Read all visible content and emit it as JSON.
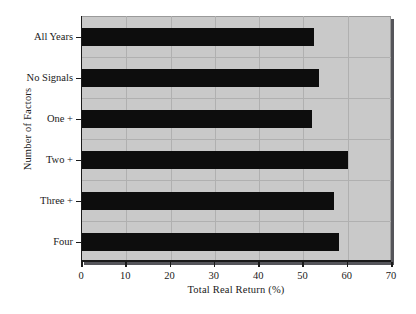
{
  "chart_data": {
    "type": "bar",
    "orientation": "horizontal",
    "title": "",
    "xlabel": "Total Real Return (%)",
    "ylabel": "Number of Factors",
    "categories": [
      "All Years",
      "No Signals",
      "One +",
      "Two +",
      "Three +",
      "Four"
    ],
    "values": [
      52.4,
      53.5,
      51.9,
      60.0,
      56.9,
      58.0
    ],
    "xlim": [
      0,
      70
    ],
    "xticks": [
      0,
      10,
      20,
      30,
      40,
      50,
      60,
      70
    ],
    "xtick_labels": [
      "0",
      "10",
      "20",
      "30",
      "40",
      "50",
      "60",
      "70"
    ],
    "grid": true,
    "legend": "none",
    "colors": {
      "bar": "#0d0d0d",
      "plot_background": "#c9c9c9",
      "gridline": "#b0b0b0",
      "axis": "#1a1a1a",
      "figure_background": "#ffffff",
      "frame_shadow": "#55555a"
    }
  }
}
